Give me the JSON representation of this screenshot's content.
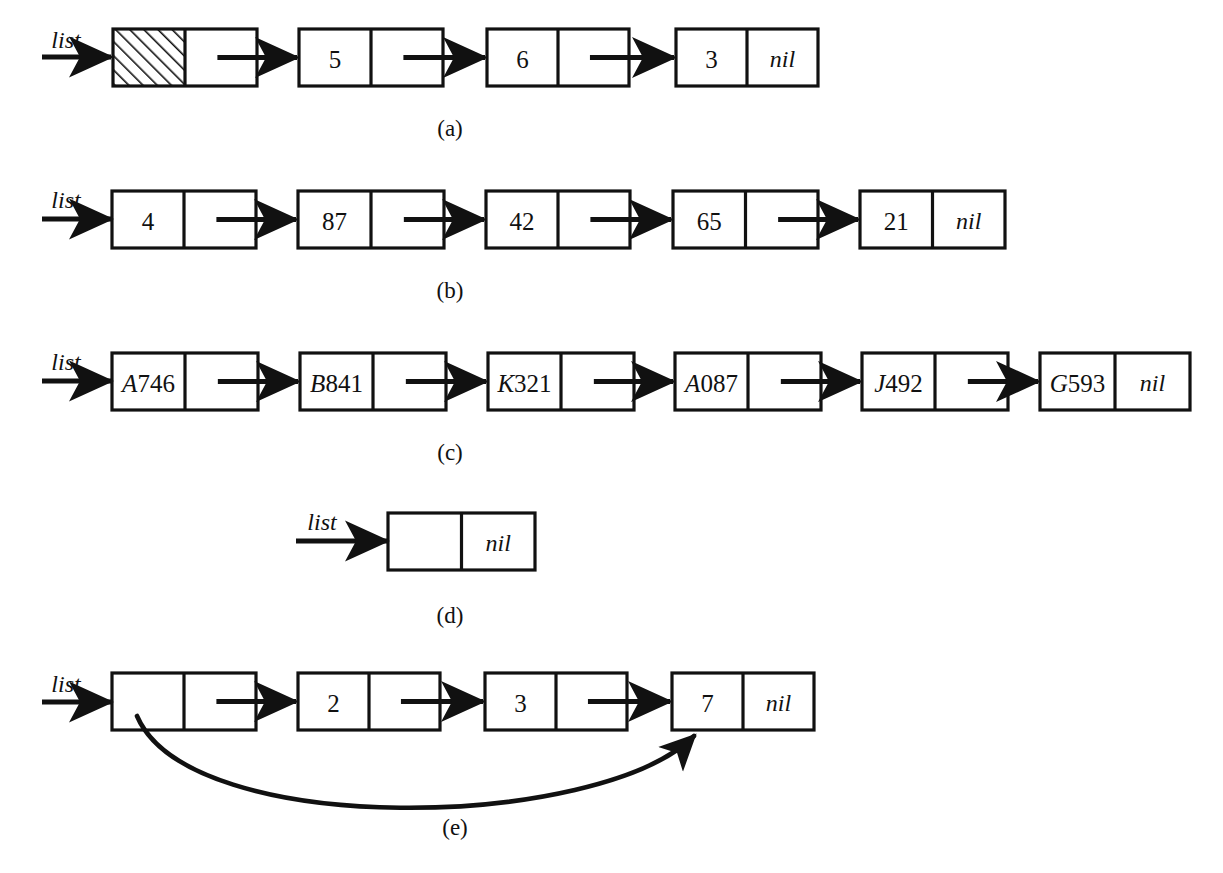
{
  "figure": {
    "background_color": "#ffffff",
    "ink_color": "#111111",
    "pointer_label": "list",
    "nil_label": "nil",
    "rows": [
      {
        "caption": "(a)",
        "caption_x": 450,
        "caption_y": 128,
        "label": "list",
        "label_x": 66,
        "label_y": 40,
        "arrow_y": 57,
        "arrow_x1": 42,
        "arrow_x2": 112,
        "node_top": 29,
        "node_height": 57,
        "nodes": [
          {
            "x": 113,
            "w": 144,
            "value": "",
            "hatched": true,
            "nil": false
          },
          {
            "x": 299,
            "w": 144,
            "value": "5",
            "hatched": false,
            "nil": false
          },
          {
            "x": 487,
            "w": 142,
            "value": "6",
            "hatched": false,
            "nil": false
          },
          {
            "x": 676,
            "w": 142,
            "value": "3",
            "hatched": false,
            "nil": true
          }
        ]
      },
      {
        "caption": "(b)",
        "caption_x": 450,
        "caption_y": 290,
        "label": "list",
        "label_x": 66,
        "label_y": 200,
        "arrow_y": 219,
        "arrow_x1": 42,
        "arrow_x2": 112,
        "node_top": 191,
        "node_height": 57,
        "nodes": [
          {
            "x": 112,
            "w": 144,
            "value": "4",
            "hatched": false,
            "nil": false
          },
          {
            "x": 298,
            "w": 146,
            "value": "87",
            "hatched": false,
            "nil": false
          },
          {
            "x": 486,
            "w": 144,
            "value": "42",
            "hatched": false,
            "nil": false
          },
          {
            "x": 673,
            "w": 145,
            "value": "65",
            "hatched": false,
            "nil": false
          },
          {
            "x": 860,
            "w": 145,
            "value": "21",
            "hatched": false,
            "nil": true
          }
        ]
      },
      {
        "caption": "(c)",
        "caption_x": 450,
        "caption_y": 452,
        "label": "list",
        "label_x": 66,
        "label_y": 362,
        "arrow_y": 381,
        "arrow_x1": 42,
        "arrow_x2": 112,
        "node_top": 353,
        "node_height": 57,
        "nodes": [
          {
            "x": 112,
            "w": 146,
            "value": "A746",
            "hatched": false,
            "nil": false
          },
          {
            "x": 300,
            "w": 146,
            "value": "B841",
            "hatched": false,
            "nil": false
          },
          {
            "x": 488,
            "w": 146,
            "value": "K321",
            "hatched": false,
            "nil": false
          },
          {
            "x": 675,
            "w": 146,
            "value": "A087",
            "hatched": false,
            "nil": false
          },
          {
            "x": 862,
            "w": 146,
            "value": "J492",
            "hatched": false,
            "nil": false
          },
          {
            "x": 1040,
            "w": 150,
            "value": "G593",
            "hatched": false,
            "nil": true
          }
        ]
      },
      {
        "caption": "(d)",
        "caption_x": 450,
        "caption_y": 615,
        "label": "list",
        "label_x": 322,
        "label_y": 522,
        "arrow_y": 541,
        "arrow_x1": 296,
        "arrow_x2": 388,
        "node_top": 513,
        "node_height": 57,
        "nodes": [
          {
            "x": 388,
            "w": 147,
            "value": "",
            "hatched": false,
            "nil": true
          }
        ]
      },
      {
        "caption": "(e)",
        "caption_x": 455,
        "caption_y": 827,
        "label": "list",
        "label_x": 66,
        "label_y": 684,
        "arrow_y": 702,
        "arrow_x1": 42,
        "arrow_x2": 112,
        "node_top": 673,
        "node_height": 57,
        "nodes": [
          {
            "x": 112,
            "w": 144,
            "value": "",
            "hatched": false,
            "nil": false
          },
          {
            "x": 298,
            "w": 142,
            "value": "2",
            "hatched": false,
            "nil": false
          },
          {
            "x": 485,
            "w": 142,
            "value": "3",
            "hatched": false,
            "nil": false
          },
          {
            "x": 672,
            "w": 142,
            "value": "7",
            "hatched": false,
            "nil": true
          }
        ],
        "curved_arrow": {
          "from_x": 137,
          "from_y": 716,
          "to_x": 694,
          "to_y": 736,
          "c1_x": 190,
          "c1_y": 840,
          "c2_x": 600,
          "c2_y": 830
        }
      }
    ]
  }
}
